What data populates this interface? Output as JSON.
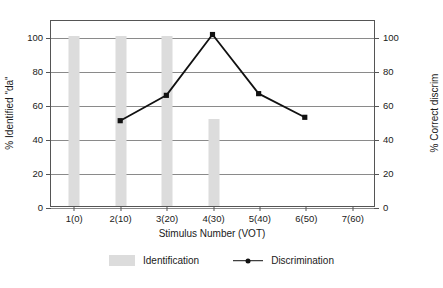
{
  "chart_data": {
    "type": "bar",
    "title": "",
    "xlabel": "Stimulus Number (VOT)",
    "ylabel": "% Identified \"da\"",
    "y2label": "% Correct discrim",
    "categories": [
      "1(0)",
      "2(10)",
      "3(20)",
      "4(30)",
      "5(40)",
      "6(50)",
      "7(60)"
    ],
    "ylim": [
      0,
      110
    ],
    "y2lim": [
      0,
      110
    ],
    "yticks": [
      "0",
      "20",
      "40",
      "60",
      "80",
      "100"
    ],
    "ytick_values": [
      0,
      20,
      40,
      60,
      80,
      100
    ],
    "y2ticks": [
      "0",
      "20",
      "40",
      "60",
      "80",
      "100"
    ],
    "y2tick_values": [
      0,
      20,
      40,
      60,
      80,
      100
    ],
    "grid": true,
    "legend_position": "bottom",
    "series": [
      {
        "name": "Identification",
        "type": "bar",
        "axis": "left",
        "color": "#dcdcdc",
        "values": [
          100,
          100,
          100,
          51,
          0,
          0,
          0
        ]
      },
      {
        "name": "Discrimination",
        "type": "line",
        "axis": "right",
        "color": "#111111",
        "marker": "square",
        "values": [
          null,
          51,
          66,
          102,
          67,
          53,
          null
        ]
      }
    ]
  },
  "legend": {
    "items": [
      {
        "label": "Identification",
        "swatch": "bar-swatch",
        "color": "#dcdcdc"
      },
      {
        "label": "Discrimination",
        "swatch": "line-marker-swatch",
        "color": "#111111"
      }
    ]
  }
}
